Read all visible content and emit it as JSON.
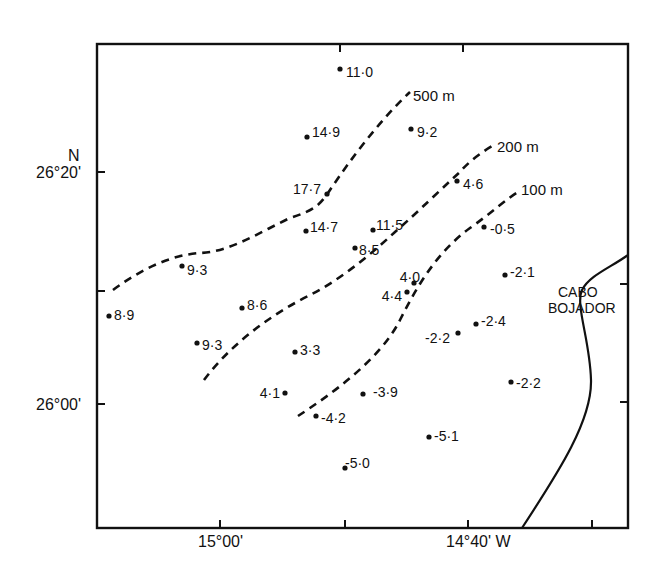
{
  "figure": {
    "type": "map",
    "axes": {
      "latitude_labels": [
        {
          "text": "26°20'",
          "value": "26°20' N"
        },
        {
          "text": "26°00'",
          "value": "26°00' N"
        }
      ],
      "north_indicator": "N",
      "longitude_labels": [
        {
          "text": "15°00'",
          "value": "15°00' W"
        },
        {
          "text": "14°40' W",
          "value": "14°40' W"
        }
      ]
    },
    "contours": [
      {
        "label": "500 m",
        "depth_m": 500
      },
      {
        "label": "200 m",
        "depth_m": 200
      },
      {
        "label": "100 m",
        "depth_m": 100
      }
    ],
    "place_label": [
      "CABO",
      "BOJADOR"
    ],
    "stations": [
      {
        "value": "11.0"
      },
      {
        "value": "14.9"
      },
      {
        "value": "9.2"
      },
      {
        "value": "17.7"
      },
      {
        "value": "4.6"
      },
      {
        "value": "14.7"
      },
      {
        "value": "11.5"
      },
      {
        "value": "8.5"
      },
      {
        "value": "-0.5"
      },
      {
        "value": "9.3"
      },
      {
        "value": "-2.1"
      },
      {
        "value": "4.0"
      },
      {
        "value": "4.4"
      },
      {
        "value": "8.9"
      },
      {
        "value": "8.6"
      },
      {
        "value": "-2.4"
      },
      {
        "value": "9.3"
      },
      {
        "value": "-2.2"
      },
      {
        "value": "3.3"
      },
      {
        "value": "4.1"
      },
      {
        "value": "-3.9"
      },
      {
        "value": "-2.2"
      },
      {
        "value": "-4.2"
      },
      {
        "value": "-5.1"
      },
      {
        "value": "-5.0"
      }
    ]
  }
}
